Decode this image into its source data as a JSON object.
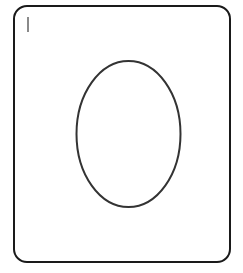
{
  "canvas": {
    "width": 243,
    "height": 273,
    "background": "#ffffff"
  },
  "frame": {
    "border_color": "#1a1a1a",
    "corner_radius": 14
  },
  "text_cursor": {
    "color": "#8a8a8a"
  },
  "shape": {
    "type": "ellipse",
    "cx": 128.5,
    "cy": 134,
    "rx": 52,
    "ry": 73,
    "stroke": "#333333",
    "fill": "none"
  }
}
